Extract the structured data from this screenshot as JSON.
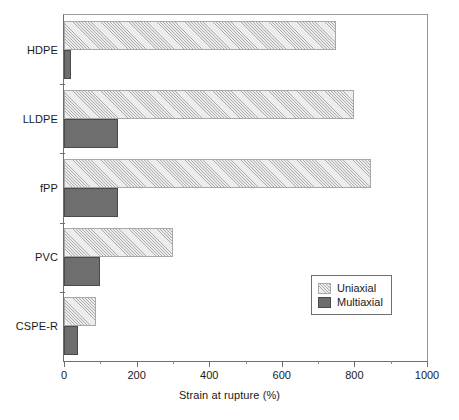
{
  "chart_data": {
    "type": "bar",
    "orientation": "horizontal",
    "title": "",
    "xlabel": "Strain at rupture (%)",
    "ylabel": "",
    "xlim": [
      0,
      1000
    ],
    "xticks": [
      0,
      200,
      400,
      600,
      800,
      1000
    ],
    "xtick_labels": [
      "0",
      "200",
      "400",
      "600",
      "800",
      "1000"
    ],
    "minor_xticks": [
      100,
      300,
      500,
      700,
      900
    ],
    "grid": false,
    "legend_position": "lower right",
    "categories": [
      "HDPE",
      "LLDPE",
      "fPP",
      "PVC",
      "CSPE-R"
    ],
    "series": [
      {
        "name": "Uniaxial",
        "color": "#ececec",
        "pattern": "diagonal-hatch",
        "values": [
          750,
          800,
          845,
          300,
          88
        ]
      },
      {
        "name": "Multiaxial",
        "color": "#6e6e6e",
        "pattern": "solid",
        "values": [
          18,
          150,
          150,
          100,
          38
        ]
      }
    ]
  },
  "axis": {
    "x_title": "Strain at rupture (%)",
    "tick_labels": [
      "0",
      "200",
      "400",
      "600",
      "800",
      "1000"
    ],
    "category_labels": [
      "HDPE",
      "LLDPE",
      "fPP",
      "PVC",
      "CSPE-R"
    ]
  },
  "legend": {
    "entries": [
      {
        "label": "Uniaxial",
        "swatch": "uniaxial-hatch-swatch"
      },
      {
        "label": "Multiaxial",
        "swatch": "multiaxial-solid-swatch"
      }
    ]
  },
  "colors": {
    "uniaxial_fill": "#ececec",
    "uniaxial_edge": "#a8a8a8",
    "multiaxial_fill": "#6e6e6e",
    "multiaxial_edge": "#4a4a4a",
    "axis": "#6f6f6f",
    "text": "#1a1a1a",
    "background": "#ffffff"
  }
}
